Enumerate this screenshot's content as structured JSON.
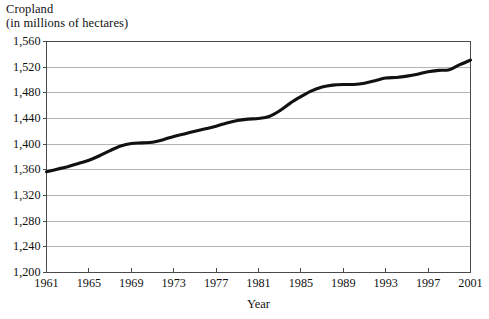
{
  "chart_data": {
    "type": "line",
    "title": "Cropland",
    "subtitle": "(in millions of hectares)",
    "xlabel": "Year",
    "ylabel": "",
    "xlim": [
      1961,
      2001
    ],
    "ylim": [
      1200,
      1560
    ],
    "grid": true,
    "legend": null,
    "yticks": [
      1200,
      1240,
      1280,
      1320,
      1360,
      1400,
      1440,
      1480,
      1520,
      1560
    ],
    "ytick_labels": [
      "1,200",
      "1,240",
      "1,280",
      "1,320",
      "1,360",
      "1,400",
      "1,440",
      "1,480",
      "1,520",
      "1,560"
    ],
    "xticks": [
      1961,
      1965,
      1969,
      1973,
      1977,
      1981,
      1985,
      1989,
      1993,
      1997,
      2001
    ],
    "xtick_labels": [
      "1961",
      "1965",
      "1969",
      "1973",
      "1977",
      "1981",
      "1985",
      "1989",
      "1993",
      "1997",
      "2001"
    ],
    "line_color": "#111111",
    "line_width": 3.1,
    "grid_color": "#b4b4b4",
    "axis_color": "#4a4a4a",
    "x": [
      1961,
      1962,
      1963,
      1964,
      1965,
      1966,
      1967,
      1968,
      1969,
      1970,
      1971,
      1972,
      1973,
      1974,
      1975,
      1976,
      1977,
      1978,
      1979,
      1980,
      1981,
      1982,
      1983,
      1984,
      1985,
      1986,
      1987,
      1988,
      1989,
      1990,
      1991,
      1992,
      1993,
      1994,
      1995,
      1996,
      1997,
      1998,
      1999,
      2000,
      2001
    ],
    "values": [
      1357,
      1361,
      1365,
      1370,
      1375,
      1382,
      1390,
      1397,
      1401,
      1402,
      1403,
      1407,
      1412,
      1416,
      1420,
      1424,
      1428,
      1433,
      1437,
      1439,
      1440,
      1443,
      1452,
      1464,
      1474,
      1483,
      1489,
      1492,
      1493,
      1493,
      1495,
      1499,
      1503,
      1504,
      1506,
      1509,
      1513,
      1515,
      1516,
      1524,
      1531
    ]
  }
}
